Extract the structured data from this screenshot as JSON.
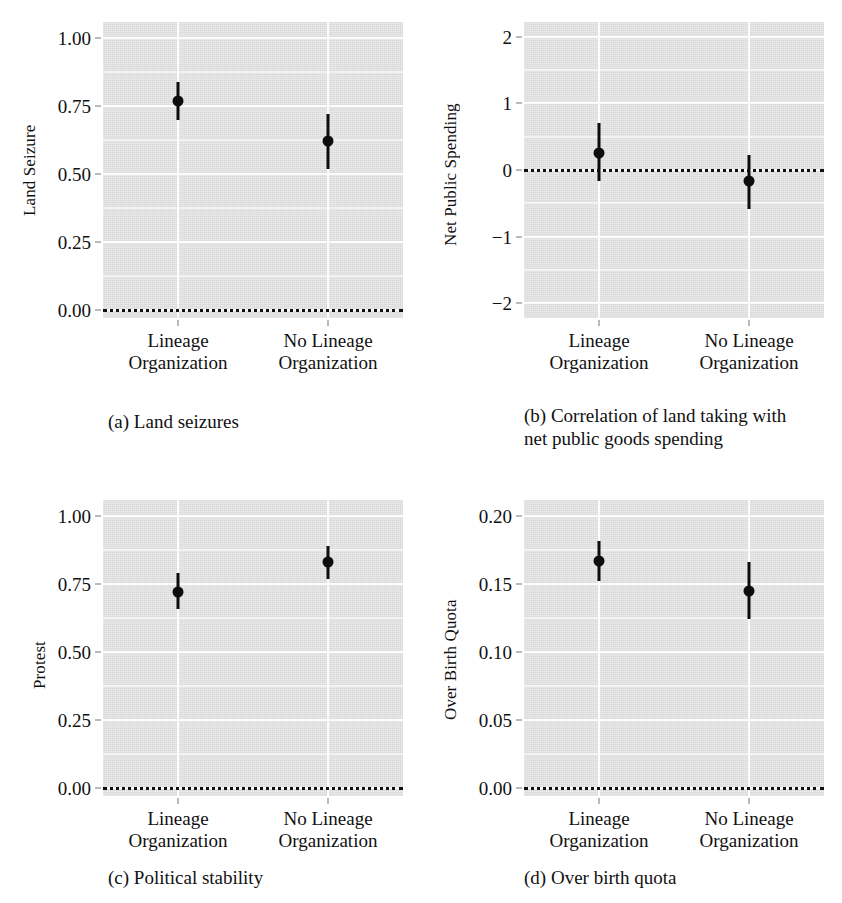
{
  "figure": {
    "background": "#ffffff",
    "panel_background": "#e7e7e7",
    "gridline_color": "#fcfcfc",
    "marker_color": "#0d0d0d"
  },
  "chart_data": [
    {
      "id": "a",
      "type": "scatter",
      "title": "(a) Land seizures",
      "caption_lines": [
        "(a) Land seizures"
      ],
      "xlabel": "",
      "ylabel": "Land Seizure",
      "categories": [
        "Lineage Organization",
        "No Lineage Organization"
      ],
      "category_lines": [
        [
          "Lineage",
          "Organization"
        ],
        [
          "No Lineage",
          "Organization"
        ]
      ],
      "values": [
        0.77,
        0.62
      ],
      "ci_low": [
        0.7,
        0.52
      ],
      "ci_high": [
        0.84,
        0.72
      ],
      "ylim": [
        -0.03,
        1.06
      ],
      "yticks": [
        0.0,
        0.25,
        0.5,
        0.75,
        1.0
      ],
      "ytick_labels": [
        "0.00",
        "0.25",
        "0.50",
        "0.75",
        "1.00"
      ],
      "minor_yticks": [
        0.125,
        0.375,
        0.625,
        0.875
      ],
      "reference_line": 0.0,
      "grid": true,
      "legend": "none"
    },
    {
      "id": "b",
      "type": "scatter",
      "title": "(b) Correlation of land taking with net public goods spending",
      "caption_lines": [
        "(b) Correlation of land taking with",
        "net public goods spending"
      ],
      "xlabel": "",
      "ylabel": "Net Public Spending",
      "categories": [
        "Lineage Organization",
        "No Lineage Organization"
      ],
      "category_lines": [
        [
          "Lineage",
          "Organization"
        ],
        [
          "No Lineage",
          "Organization"
        ]
      ],
      "values": [
        0.25,
        -0.17
      ],
      "ci_low": [
        -0.17,
        -0.58
      ],
      "ci_high": [
        0.71,
        0.22
      ],
      "ylim": [
        -2.22,
        2.22
      ],
      "yticks": [
        -2,
        -1,
        0,
        1,
        2
      ],
      "ytick_labels": [
        "−2",
        "−1",
        "0",
        "1",
        "2"
      ],
      "minor_yticks": [
        -1.5,
        -0.5,
        0.5,
        1.5
      ],
      "reference_line": 0,
      "grid": true,
      "legend": "none"
    },
    {
      "id": "c",
      "type": "scatter",
      "title": "(c) Political stability",
      "caption_lines": [
        "(c) Political stability"
      ],
      "xlabel": "",
      "ylabel": "Protest",
      "categories": [
        "Lineage Organization",
        "No Lineage Organization"
      ],
      "category_lines": [
        [
          "Lineage",
          "Organization"
        ],
        [
          "No Lineage",
          "Organization"
        ]
      ],
      "values": [
        0.72,
        0.83
      ],
      "ci_low": [
        0.66,
        0.77
      ],
      "ci_high": [
        0.79,
        0.89
      ],
      "ylim": [
        -0.03,
        1.06
      ],
      "yticks": [
        0.0,
        0.25,
        0.5,
        0.75,
        1.0
      ],
      "ytick_labels": [
        "0.00",
        "0.25",
        "0.50",
        "0.75",
        "1.00"
      ],
      "minor_yticks": [
        0.125,
        0.375,
        0.625,
        0.875
      ],
      "reference_line": 0.0,
      "grid": true,
      "legend": "none"
    },
    {
      "id": "d",
      "type": "scatter",
      "title": "(d) Over birth quota",
      "caption_lines": [
        "(d) Over birth quota"
      ],
      "xlabel": "",
      "ylabel": "Over Birth Quota",
      "categories": [
        "Lineage Organization",
        "No Lineage Organization"
      ],
      "category_lines": [
        [
          "Lineage",
          "Organization"
        ],
        [
          "No Lineage",
          "Organization"
        ]
      ],
      "values": [
        0.167,
        0.145
      ],
      "ci_low": [
        0.152,
        0.124
      ],
      "ci_high": [
        0.182,
        0.166
      ],
      "ylim": [
        -0.006,
        0.212
      ],
      "yticks": [
        0.0,
        0.05,
        0.1,
        0.15,
        0.2
      ],
      "ytick_labels": [
        "0.00",
        "0.05",
        "0.10",
        "0.15",
        "0.20"
      ],
      "minor_yticks": [
        0.025,
        0.075,
        0.125,
        0.175
      ],
      "reference_line": 0.0,
      "grid": true,
      "legend": "none"
    }
  ]
}
